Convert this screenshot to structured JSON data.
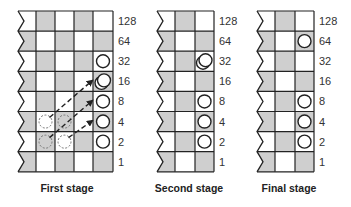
{
  "colors": {
    "shaded": "#cfcfcf",
    "light": "#ffffff",
    "line": "#222222",
    "circle": "#222222",
    "ghost": "#777777"
  },
  "row_labels": [
    "128",
    "64",
    "32",
    "16",
    "8",
    "4",
    "2",
    "1"
  ],
  "panels": [
    {
      "caption": "First stage",
      "columns": 5,
      "first_cell_shaded_in_top_row": false,
      "circles": [
        {
          "row": 2,
          "col": 4,
          "double": false
        },
        {
          "row": 3,
          "col": 4,
          "double": true
        },
        {
          "row": 4,
          "col": 4,
          "double": false
        },
        {
          "row": 5,
          "col": 4,
          "double": false
        },
        {
          "row": 6,
          "col": 4,
          "double": false
        }
      ],
      "ghost_circles": [
        {
          "row": 5,
          "col": 1
        },
        {
          "row": 5,
          "col": 2
        },
        {
          "row": 6,
          "col": 1
        },
        {
          "row": 6,
          "col": 2
        }
      ],
      "arrows": [
        {
          "from": {
            "row": 5,
            "col": 1
          },
          "to_row": 3
        },
        {
          "from": {
            "row": 6,
            "col": 1
          },
          "to_row": 4
        },
        {
          "from": {
            "row": 6,
            "col": 2
          },
          "to_row": 5
        }
      ]
    },
    {
      "caption": "Second stage",
      "columns": 3,
      "first_cell_shaded_in_top_row": false,
      "circles": [
        {
          "row": 2,
          "col": 2,
          "double": true
        },
        {
          "row": 4,
          "col": 2,
          "double": false
        },
        {
          "row": 5,
          "col": 2,
          "double": false
        },
        {
          "row": 6,
          "col": 2,
          "double": false
        }
      ],
      "ghost_circles": [],
      "arrows": []
    },
    {
      "caption": "Final stage",
      "columns": 3,
      "first_cell_shaded_in_top_row": false,
      "circles": [
        {
          "row": 1,
          "col": 2,
          "double": false
        },
        {
          "row": 4,
          "col": 2,
          "double": false
        },
        {
          "row": 5,
          "col": 2,
          "double": false
        },
        {
          "row": 6,
          "col": 2,
          "double": false
        }
      ],
      "ghost_circles": [],
      "arrows": []
    }
  ]
}
